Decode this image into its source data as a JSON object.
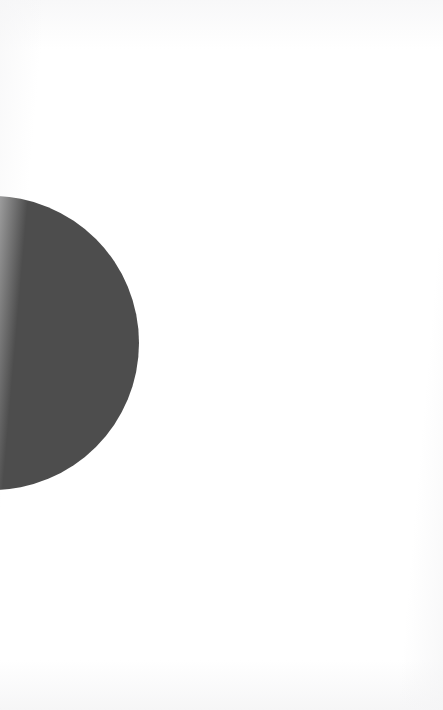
{
  "page": {
    "width": 443,
    "height": 710,
    "background_color": "#ffffff"
  },
  "figure": {
    "name": "dark-circle",
    "shape": "circle",
    "fill_color": "#4d4d4d",
    "center_x": -8,
    "center_y": 343,
    "radius": 147,
    "cropped_edge": "left",
    "visible_top_y": 196,
    "visible_bottom_y": 490,
    "visible_right_x": 139
  },
  "chart_data": {
    "type": "pie",
    "title": "",
    "subtitle": "",
    "xlabel": "",
    "ylabel": "",
    "grid": false,
    "legend_position": "none",
    "categories": [
      "Whole"
    ],
    "values": [
      100
    ],
    "colors": [
      "#4d4d4d"
    ],
    "annotations": []
  },
  "text": {
    "body": "",
    "caption": "",
    "page_number": ""
  }
}
